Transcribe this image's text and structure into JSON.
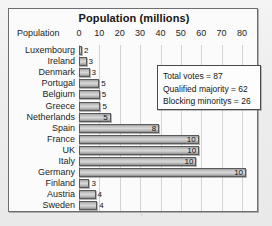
{
  "chart_data": {
    "type": "bar",
    "orientation": "horizontal",
    "title": "Population (millions)",
    "xlabel": "Population",
    "ylabel": "",
    "xlim": [
      0,
      80
    ],
    "xticks": [
      0,
      10,
      20,
      30,
      40,
      50,
      60,
      70,
      80
    ],
    "xtick_labels": [
      "0",
      "10",
      "20",
      "30",
      "40",
      "50",
      "60",
      "70",
      "80"
    ],
    "grid": true,
    "legend": "none",
    "categories": [
      "Luxembourg",
      "Ireland",
      "Denmark",
      "Portugal",
      "Belgium",
      "Greece",
      "Netherlands",
      "Spain",
      "France",
      "UK",
      "Italy",
      "Germany",
      "Finland",
      "Austria",
      "Sweden"
    ],
    "values": [
      0.4,
      3.7,
      5.2,
      9.9,
      10.2,
      10.5,
      15.6,
      39.4,
      58.7,
      59.0,
      57.6,
      82.0,
      5.1,
      8.1,
      8.9
    ],
    "data_labels": [
      "2",
      "3",
      "3",
      "5",
      "5",
      "5",
      "5",
      "8",
      "10",
      "10",
      "10",
      "10",
      "3",
      "4",
      "4"
    ],
    "data_label_meaning": "Council votes",
    "annotations": [
      "Total votes = 87",
      "Qualified majority = 62",
      "Blocking minoritys = 26"
    ]
  },
  "info_box": {
    "lines": [
      "Total votes = 87",
      "Qualified majority = 62",
      "Blocking minoritys = 26"
    ]
  }
}
